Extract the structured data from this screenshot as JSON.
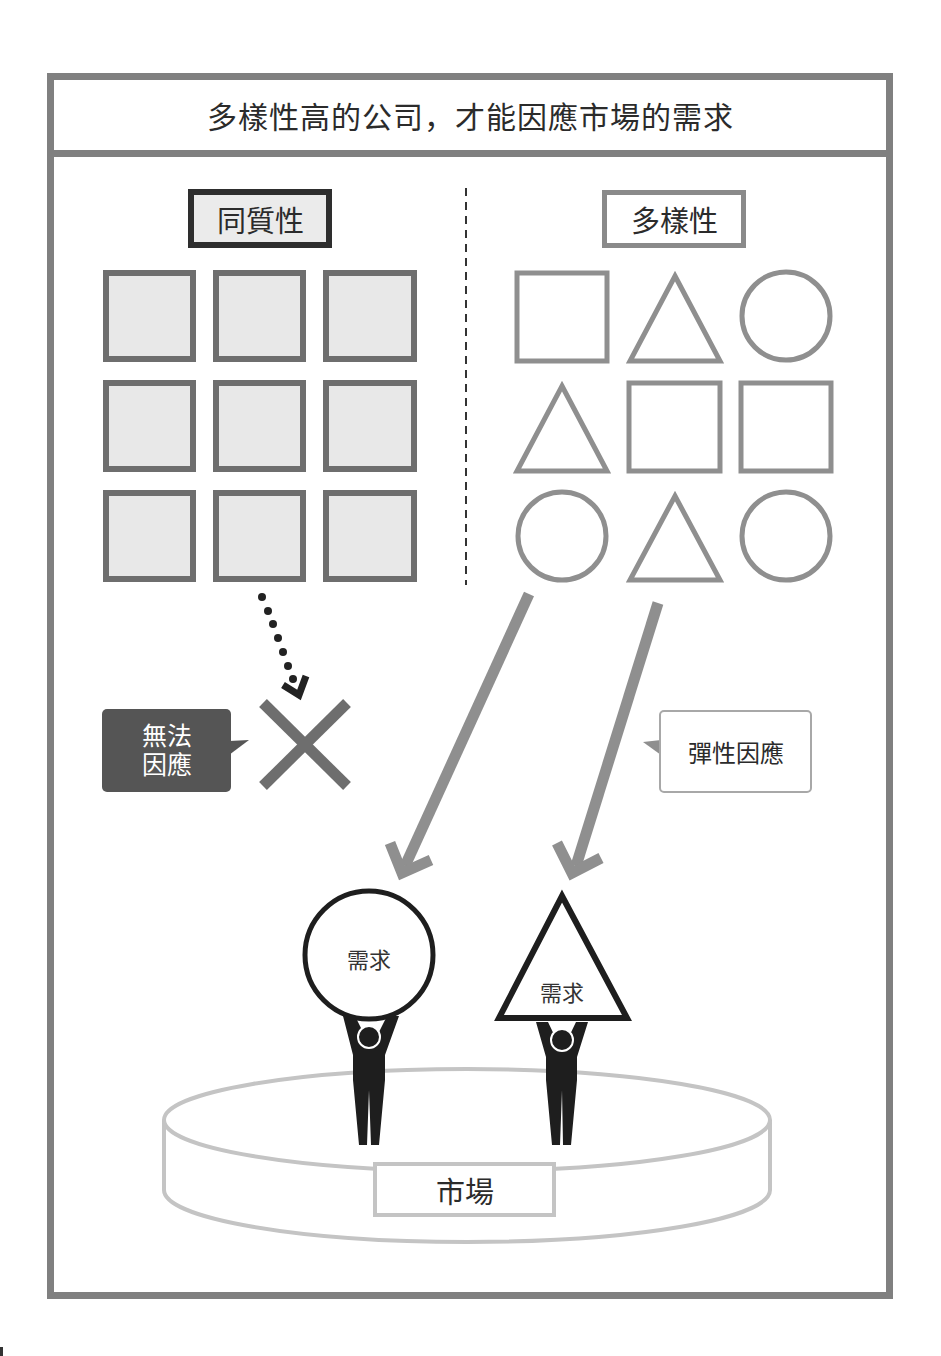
{
  "title": "多樣性高的公司，才能因應市場的需求",
  "left_panel": {
    "label": "同質性",
    "shapes": [
      "square",
      "square",
      "square",
      "square",
      "square",
      "square",
      "square",
      "square",
      "square"
    ],
    "callout": {
      "line1": "無法",
      "line2": "因應"
    },
    "result_icon": "cross-icon"
  },
  "right_panel": {
    "label": "多樣性",
    "shapes": [
      "square",
      "triangle",
      "circle",
      "triangle",
      "square",
      "square",
      "circle",
      "triangle",
      "circle"
    ],
    "callout": "彈性因應"
  },
  "market": {
    "label": "市場",
    "demands": [
      {
        "shape": "circle",
        "label": "需求"
      },
      {
        "shape": "triangle",
        "label": "需求"
      }
    ]
  },
  "colors": {
    "frame": "#808080",
    "shape_stroke_left": "#6e6e6e",
    "shape_fill_left": "#e8e8e8",
    "shape_stroke_right": "#8f8f8f",
    "arrow": "#8f8f8f",
    "figure": "#1e1e1e",
    "platform": "#c4c4c4",
    "callout_dark": "#555555"
  }
}
